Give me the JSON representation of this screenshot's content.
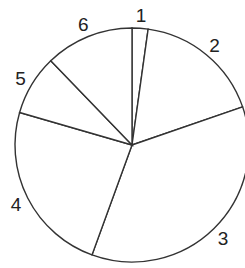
{
  "chart_data": {
    "type": "pie",
    "title": "",
    "categories": [
      "1",
      "2",
      "3",
      "4",
      "5",
      "6"
    ],
    "values": [
      2.2,
      17.5,
      35.8,
      23.9,
      8.3,
      12.2
    ],
    "start_angle_deg": 0,
    "direction": "clockwise",
    "fill": "#ffffff",
    "stroke": "#333333",
    "legend": "none",
    "labels_outside": true
  },
  "geometry": {
    "cx": 132,
    "cy": 145,
    "r": 117
  }
}
